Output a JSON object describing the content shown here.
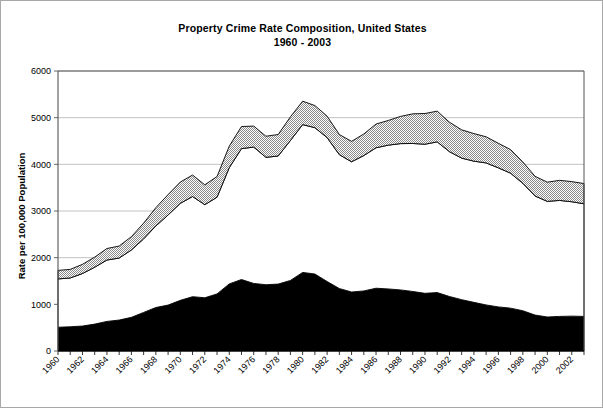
{
  "figure": {
    "title": "Property Crime Rate Composition, United States",
    "subtitle": "1960 - 2003",
    "border_color": "#a8a8a8",
    "background": "#ffffff"
  },
  "axes": {
    "y_axis_title": "Rate per 100,000 Population",
    "y_ticks": [
      "0",
      "1000",
      "2000",
      "3000",
      "4000",
      "5000",
      "6000"
    ],
    "x_ticks": [
      "1960",
      "1962",
      "1964",
      "1966",
      "1968",
      "1970",
      "1972",
      "1974",
      "1976",
      "1978",
      "1980",
      "1982",
      "1984",
      "1986",
      "1988",
      "1990",
      "1992",
      "1994",
      "1996",
      "1998",
      "2000",
      "2002"
    ],
    "grid_color": "#9a9a9a",
    "axis_color": "#555555"
  },
  "chart_data": {
    "type": "area",
    "title": "Property Crime Rate Composition, United States 1960 - 2003",
    "xlabel": "",
    "ylabel": "Rate per 100,000 Population",
    "ylim": [
      0,
      6000
    ],
    "xlim": [
      1960,
      2003
    ],
    "grid": true,
    "stacked": true,
    "legend_position": "none",
    "x": [
      1960,
      1961,
      1962,
      1963,
      1964,
      1965,
      1966,
      1967,
      1968,
      1969,
      1970,
      1971,
      1972,
      1973,
      1974,
      1975,
      1976,
      1977,
      1978,
      1979,
      1980,
      1981,
      1982,
      1983,
      1984,
      1985,
      1986,
      1987,
      1988,
      1989,
      1990,
      1991,
      1992,
      1993,
      1994,
      1995,
      1996,
      1997,
      1998,
      1999,
      2000,
      2001,
      2002,
      2003
    ],
    "series": [
      {
        "name": "burglary",
        "fill": "#000000",
        "values": [
          509,
          519,
          535,
          576,
          634,
          663,
          721,
          827,
          932,
          984,
          1085,
          1164,
          1141,
          1223,
          1438,
          1532,
          1448,
          1420,
          1434,
          1512,
          1684,
          1650,
          1489,
          1338,
          1264,
          1287,
          1345,
          1330,
          1309,
          1276,
          1236,
          1252,
          1168,
          1100,
          1042,
          987,
          945,
          918,
          863,
          770,
          729,
          741,
          747,
          741
        ]
      },
      {
        "name": "larceny-theft",
        "fill": "#ffffff",
        "values": [
          1035,
          1046,
          1125,
          1219,
          1315,
          1329,
          1443,
          1576,
          1747,
          1931,
          2079,
          2146,
          1994,
          2072,
          2490,
          2805,
          2921,
          2730,
          2744,
          2999,
          3167,
          3135,
          3084,
          2869,
          2791,
          2901,
          3010,
          3081,
          3135,
          3171,
          3195,
          3229,
          3103,
          3033,
          3026,
          3043,
          2980,
          2892,
          2729,
          2551,
          2477,
          2486,
          2451,
          2414
        ]
      },
      {
        "name": "motor-vehicle-theft",
        "fill": "#dcdcdc",
        "pattern": "stipple",
        "values": [
          183,
          184,
          197,
          216,
          247,
          257,
          286,
          336,
          393,
          436,
          457,
          460,
          426,
          443,
          462,
          474,
          450,
          452,
          461,
          506,
          502,
          475,
          459,
          431,
          437,
          463,
          508,
          529,
          583,
          635,
          658,
          659,
          632,
          606,
          591,
          560,
          526,
          506,
          459,
          422,
          412,
          430,
          432,
          433
        ]
      }
    ],
    "totals": [
      1727,
      1749,
      1857,
      2012,
      2198,
      2249,
      2450,
      2736,
      3071,
      3351,
      3621,
      3769,
      3561,
      3737,
      4390,
      4811,
      4820,
      4602,
      4639,
      5017,
      5353,
      5264,
      5033,
      4637,
      4492,
      4651,
      4863,
      4940,
      5027,
      5078,
      5089,
      5140,
      4903,
      4740,
      4659,
      4591,
      4451,
      4316,
      4052,
      3743,
      3618,
      3658,
      3630,
      3588
    ]
  }
}
